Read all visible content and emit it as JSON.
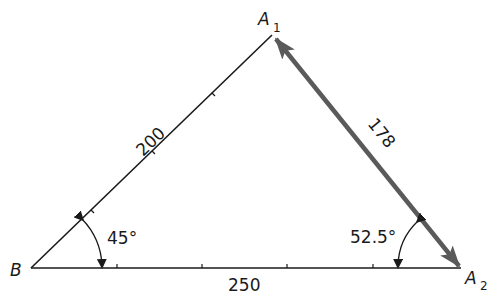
{
  "diagram": {
    "type": "triangle",
    "vertices": {
      "B": {
        "label": "B",
        "x": 31,
        "y": 268
      },
      "A1": {
        "label": "A",
        "subscript": "1",
        "x": 272,
        "y": 35
      },
      "A2": {
        "label": "A",
        "subscript": "2",
        "x": 461,
        "y": 268
      }
    },
    "sides": {
      "B_A1": {
        "length_label": "200"
      },
      "B_A2": {
        "length_label": "250"
      },
      "A1_A2": {
        "length_label": "178",
        "style": "thick arrow, double-headed"
      }
    },
    "angles": {
      "at_B": {
        "label": "45°"
      },
      "at_A2": {
        "label": "52.5°"
      }
    },
    "colors": {
      "line": "#1a1a1a",
      "vector": "#5a5a5a",
      "background": "#ffffff"
    }
  }
}
